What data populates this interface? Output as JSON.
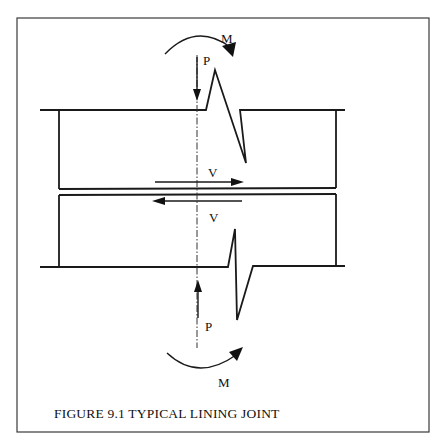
{
  "figure": {
    "caption": "FIGURE 9.1 TYPICAL LINING JOINT",
    "labels": {
      "moment_top": "M",
      "axial_top": "P",
      "shear_upper": "V",
      "shear_lower": "V",
      "axial_bottom": "P",
      "moment_bottom": "M"
    },
    "colors": {
      "line": "#1a1a1a",
      "background": "#ffffff"
    }
  }
}
